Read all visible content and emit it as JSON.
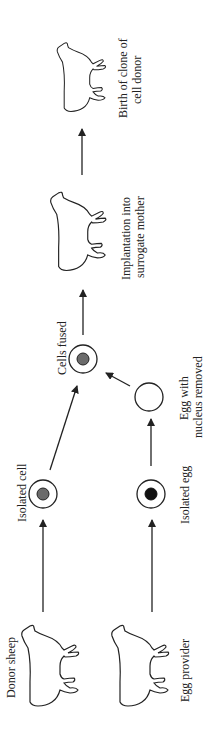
{
  "orientation": "rotated 90 degrees counterclockwise",
  "colors": {
    "line": "#222222",
    "cell_nucleus": "#6b6b6b",
    "egg_nucleus": "#111111",
    "background": "#ffffff"
  },
  "nodes": {
    "donor_sheep": {
      "label": "Donor sheep",
      "icon": "sheep-icon"
    },
    "egg_provider": {
      "label": "Egg provider",
      "icon": "sheep-icon"
    },
    "isolated_cell": {
      "label": "Isolated cell",
      "icon": "cell-grey-nucleus-icon"
    },
    "isolated_egg": {
      "label": "Isolated egg",
      "icon": "egg-black-nucleus-icon"
    },
    "egg_nucleus_removed": {
      "label_line1": "Egg with",
      "label_line2": "nucleus removed",
      "icon": "empty-egg-icon"
    },
    "cells_fused": {
      "label": "Cells fused",
      "icon": "fused-cell-icon"
    },
    "implantation": {
      "label_line1": "Implantation into",
      "label_line2": "surrogate mother",
      "icon": "sheep-icon"
    },
    "birth_clone": {
      "label_line1": "Birth of clone of",
      "label_line2": "cell donor",
      "icon": "sheep-icon"
    }
  },
  "edges": [
    {
      "from": "Donor sheep",
      "to": "Isolated cell"
    },
    {
      "from": "Egg provider",
      "to": "Isolated egg"
    },
    {
      "from": "Isolated egg",
      "to": "Egg with nucleus removed"
    },
    {
      "from": "Isolated cell",
      "to": "Cells fused"
    },
    {
      "from": "Egg with nucleus removed",
      "to": "Cells fused"
    },
    {
      "from": "Cells fused",
      "to": "Implantation into surrogate mother"
    },
    {
      "from": "Implantation into surrogate mother",
      "to": "Birth of clone of cell donor"
    }
  ]
}
